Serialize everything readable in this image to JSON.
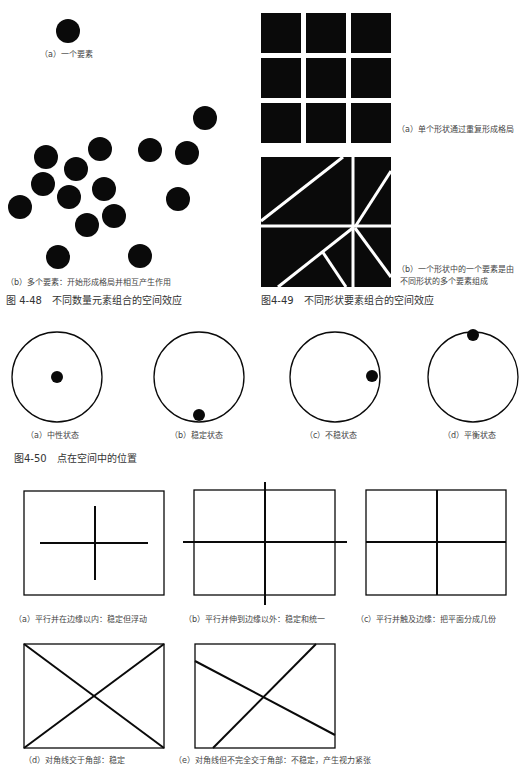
{
  "fig_4_48": {
    "title": "图 4-48　不同数量元素组合的空间效应",
    "a": {
      "label": "（a）一个要素"
    },
    "b": {
      "label": "（b）多个要素：开始形成格局并相互产生作用"
    }
  },
  "fig_4_49": {
    "title": "图4-49　不同形状要素组合的空间效应",
    "a": {
      "label": "（a）单个形状通过重复形成格局"
    },
    "b": {
      "label_line1": "（b）一个形状中的一个要素是由",
      "label_line2": "不同形状的多个要素组成"
    }
  },
  "fig_4_50": {
    "title": "图4-50　点在空间中的位置",
    "items": [
      {
        "label": "（a）中性状态"
      },
      {
        "label": "（b）稳定状态"
      },
      {
        "label": "（c）不稳状态"
      },
      {
        "label": "（d）平衡状态"
      }
    ]
  },
  "lines_fig": {
    "items": [
      {
        "label": "（a）平行并在边缘以内：稳定但浮动"
      },
      {
        "label": "（b）平行并伸到边缘以外：稳定和统一"
      },
      {
        "label": "（c）平行并触及边缘：把平面分成几份"
      },
      {
        "label": "（d）对角线交于角部：稳定"
      },
      {
        "label": "（e）对角线但不完全交于角部：不稳定，产生视力紧张"
      }
    ]
  },
  "colors": {
    "ink": "#0a0a0a",
    "text": "#444444",
    "paper": "#ffffff"
  }
}
